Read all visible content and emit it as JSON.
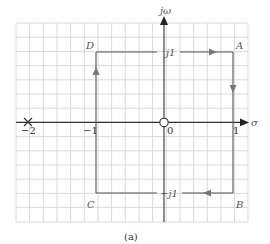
{
  "figure": {
    "caption": "(a)",
    "axes": {
      "x_label": "σ",
      "y_label": "jω",
      "x_ticks": [
        {
          "value": -2,
          "label": "−2"
        },
        {
          "value": -1,
          "label": "−1"
        },
        {
          "value": 0,
          "label": "0"
        },
        {
          "value": 1,
          "label": "1"
        }
      ],
      "y_ticks": [
        {
          "value": 1,
          "label": "j1"
        },
        {
          "value": -1,
          "label": "−j1"
        }
      ]
    },
    "contour": {
      "corners": [
        {
          "name": "A",
          "s": [
            1,
            1
          ]
        },
        {
          "name": "B",
          "s": [
            1,
            -1
          ]
        },
        {
          "name": "C",
          "s": [
            -1,
            -1
          ]
        },
        {
          "name": "D",
          "s": [
            -1,
            1
          ]
        }
      ],
      "direction": "clockwise",
      "path_order": [
        "A",
        "B",
        "C",
        "D",
        "A"
      ]
    },
    "markers": [
      {
        "type": "pole",
        "symbol": "×",
        "at": [
          -2,
          0
        ]
      },
      {
        "type": "zero",
        "symbol": "○",
        "at": [
          0,
          0
        ]
      }
    ],
    "colors": {
      "grid": "#cccccc",
      "axis": "#333333",
      "contour": "#555555",
      "label": "#666666"
    }
  }
}
